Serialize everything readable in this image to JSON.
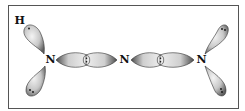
{
  "diagram": {
    "title": "",
    "atoms": [
      {
        "id": "H",
        "label": "H",
        "x": 18.5,
        "y": 24
      },
      {
        "id": "N1",
        "label": "N",
        "x": 49,
        "y": 63
      },
      {
        "id": "N2",
        "label": "N",
        "x": 124,
        "y": 63
      },
      {
        "id": "N3",
        "label": "N",
        "x": 201,
        "y": 63
      }
    ],
    "lone_pair_lobes": [
      {
        "atom": "N1",
        "direction": "up-left",
        "electrons": 1
      },
      {
        "atom": "N1",
        "direction": "down-left",
        "electrons": 2
      },
      {
        "atom": "N3",
        "direction": "up-right",
        "electrons": 2
      },
      {
        "atom": "N3",
        "direction": "down-right",
        "electrons": 2
      }
    ],
    "bonds": [
      {
        "from": "N1",
        "to": "N2",
        "type": "sigma-overlap",
        "electrons": 2
      },
      {
        "from": "N2",
        "to": "N3",
        "type": "sigma-overlap",
        "electrons": 2
      }
    ],
    "colors": {
      "frame": "#555555",
      "lobe_light": "#f2f2f2",
      "lobe_dark": "#6a6a6a",
      "text": "#111111"
    }
  }
}
